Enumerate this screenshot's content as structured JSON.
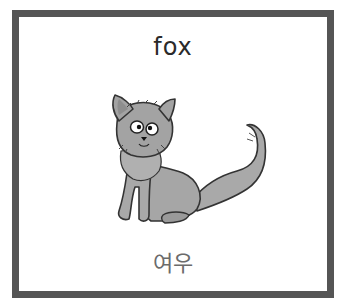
{
  "card": {
    "word_english": "fox",
    "word_korean": "여우",
    "illustration": "fox-illustration",
    "colors": {
      "border": "#555555",
      "background": "#ffffff",
      "english_text": "#2a2a2a",
      "korean_text": "#6b6b6b",
      "fox_fill": "#a9a9a9",
      "fox_outline": "#333333"
    }
  }
}
